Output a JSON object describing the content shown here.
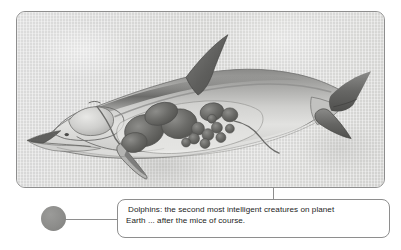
{
  "figure": {
    "illustration_name": "dolphin-anatomy-cutaway",
    "alt": "Cutaway anatomical illustration of a dolphin showing internal organs",
    "frame_border_color": "#8e8e8e",
    "background_color": "#d8d8d6"
  },
  "bullet": {
    "name": "bullet-marker",
    "color": "#8d8d8b"
  },
  "caption": {
    "text": "Dolphins: the second most intelligent creatures on planet\nEarth ... after the mice of course.",
    "line1": "Dolphins: the second most intelligent creatures on planet",
    "line2": "Earth ... after the mice of course.",
    "border_color": "#8e8e8e",
    "background_color": "#ffffff",
    "text_color": "#232323"
  },
  "connector": {
    "name": "leader-line",
    "color": "#8e8e8e"
  }
}
